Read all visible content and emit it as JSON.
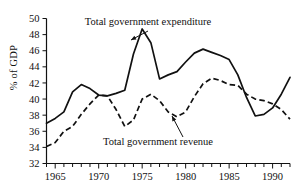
{
  "chart_data": {
    "type": "line",
    "title": "",
    "xlabel": "",
    "ylabel": "% of GDP",
    "xlim": [
      1964,
      1992
    ],
    "ylim": [
      32,
      50
    ],
    "ytick_values": [
      32,
      34,
      36,
      38,
      40,
      42,
      44,
      46,
      48,
      50
    ],
    "ytick_labels": [
      "32",
      "34",
      "36",
      "38",
      "40",
      "42",
      "44",
      "46",
      "48",
      "50"
    ],
    "xtick_values": [
      1965,
      1970,
      1975,
      1980,
      1985,
      1990
    ],
    "xtick_labels": [
      "1965",
      "1970",
      "1975",
      "1980",
      "1985",
      "1990"
    ],
    "xminor_ticks": [
      1964,
      1965,
      1966,
      1967,
      1968,
      1969,
      1970,
      1971,
      1972,
      1973,
      1974,
      1975,
      1976,
      1977,
      1978,
      1979,
      1980,
      1981,
      1982,
      1983,
      1984,
      1985,
      1986,
      1987,
      1988,
      1989,
      1990,
      1991,
      1992
    ],
    "grid": false,
    "legend": "annotations",
    "x": [
      1964,
      1965,
      1966,
      1967,
      1968,
      1969,
      1970,
      1971,
      1972,
      1973,
      1974,
      1975,
      1976,
      1977,
      1978,
      1979,
      1980,
      1981,
      1982,
      1983,
      1984,
      1985,
      1986,
      1987,
      1988,
      1989,
      1990,
      1991,
      1992
    ],
    "series": [
      {
        "name": "Total government expenditure",
        "style": "solid",
        "values": [
          37.0,
          37.6,
          38.4,
          40.9,
          41.8,
          41.3,
          40.5,
          40.4,
          40.7,
          41.1,
          45.6,
          48.7,
          47.0,
          42.5,
          43.0,
          43.4,
          44.6,
          45.7,
          46.2,
          45.8,
          45.4,
          44.9,
          43.0,
          40.2,
          37.9,
          38.1,
          38.9,
          40.6,
          42.7
        ]
      },
      {
        "name": "Total government revenue",
        "style": "dashed",
        "values": [
          34.1,
          34.6,
          36.0,
          36.6,
          38.1,
          39.4,
          40.5,
          40.4,
          38.7,
          36.6,
          37.4,
          40.0,
          40.6,
          39.8,
          38.4,
          37.8,
          38.4,
          40.3,
          41.9,
          42.6,
          42.3,
          41.8,
          41.7,
          40.6,
          40.0,
          39.8,
          39.4,
          38.7,
          37.5
        ]
      }
    ],
    "annotations": [
      {
        "name": "expenditure-label",
        "text": "Total government expenditure",
        "text_x": 148,
        "text_y": 25,
        "arrow_from_x": 148,
        "arrow_from_y": 31,
        "arrow_to_x": 131,
        "arrow_to_y": 40
      },
      {
        "name": "revenue-label",
        "text": "Total government revenue",
        "text_x": 158,
        "text_y": 145,
        "arrow_from_x": 183,
        "arrow_from_y": 137,
        "arrow_to_x": 172,
        "arrow_to_y": 116
      }
    ]
  },
  "axes": {
    "y_axis_title": "% of GDP"
  }
}
